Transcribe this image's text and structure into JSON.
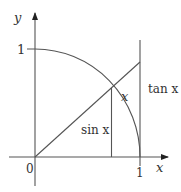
{
  "diagram": {
    "colors": {
      "stroke": "#555555",
      "text": "#333333",
      "background": "#ffffff"
    },
    "axes": {
      "x_label": "x",
      "y_label": "y",
      "origin_label": "0",
      "x_tick_label": "1",
      "y_tick_label": "1"
    },
    "labels": {
      "angle": "x",
      "sin": "sin x",
      "tan": "tan x"
    }
  }
}
